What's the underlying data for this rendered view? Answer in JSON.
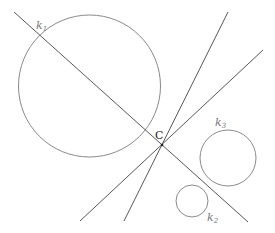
{
  "diagram": {
    "colors": {
      "circle": "#8a8a8a",
      "line": "#444444",
      "label": "#777777",
      "point_label": "#222222"
    },
    "circles": [
      {
        "id": "k1",
        "label": "k",
        "subscript": "1",
        "cx": 89.5,
        "cy": 86,
        "r": 71
      },
      {
        "id": "k2",
        "label": "k",
        "subscript": "2",
        "cx": 192,
        "cy": 201,
        "r": 16
      },
      {
        "id": "k3",
        "label": "k",
        "subscript": "3",
        "cx": 228,
        "cy": 158,
        "r": 28
      }
    ],
    "lines": [
      {
        "id": "line-1",
        "x1": 14,
        "y1": 12,
        "x2": 248,
        "y2": 222
      },
      {
        "id": "line-2",
        "x1": 228,
        "y1": 12,
        "x2": 124,
        "y2": 221
      },
      {
        "id": "line-3",
        "x1": 263,
        "y1": 50,
        "x2": 80,
        "y2": 221
      }
    ],
    "point": {
      "label": "C",
      "x": 162,
      "y": 145
    },
    "labels": {
      "k1": {
        "text": "k",
        "sub": "1"
      },
      "k2": {
        "text": "k",
        "sub": "2"
      },
      "k3": {
        "text": "k",
        "sub": "3"
      },
      "C": "C"
    }
  }
}
